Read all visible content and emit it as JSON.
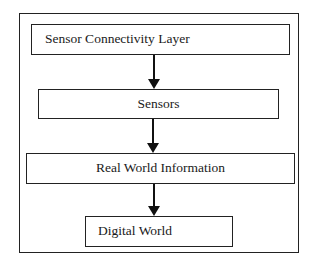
{
  "diagram": {
    "type": "flowchart",
    "direction": "top-to-bottom",
    "nodes": [
      {
        "id": "n1",
        "label": "Sensor Connectivity Layer"
      },
      {
        "id": "n2",
        "label": "Sensors"
      },
      {
        "id": "n3",
        "label": "Real World Information"
      },
      {
        "id": "n4",
        "label": "Digital World"
      }
    ],
    "edges": [
      {
        "from": "n1",
        "to": "n2"
      },
      {
        "from": "n2",
        "to": "n3"
      },
      {
        "from": "n3",
        "to": "n4"
      }
    ],
    "colors": {
      "stroke": "#222222",
      "background": "#ffffff",
      "text": "#1a1a1a"
    }
  }
}
